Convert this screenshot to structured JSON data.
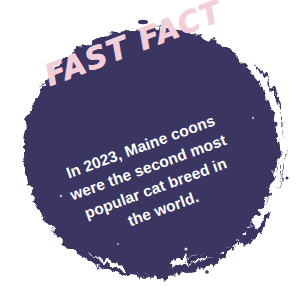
{
  "image": {
    "type": "sticker-graphic",
    "subject": "fast-fact-badge",
    "width": 304,
    "height": 296
  },
  "colors": {
    "background": "#ffffff",
    "blob_navy": "#3a3462",
    "headline_pink": "#f2cfd8",
    "body_white": "#ffffff"
  },
  "sticker": {
    "shape_name": "paint-blob-circle",
    "headline": "FAST FACT",
    "headline_rotation_deg": -21,
    "body_rotation_deg": -20,
    "body_lines": [
      "In 2023, Maine coons",
      "were the second most",
      "popular cat breed in",
      "the world."
    ],
    "body_text": "In 2023, Maine coons were the second most popular cat breed in the world."
  }
}
